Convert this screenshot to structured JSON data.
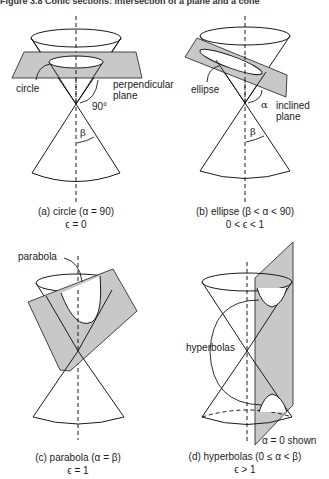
{
  "figure": {
    "title": "Figure 3.8 Conic sections: intersection of a plane and a cone",
    "panels": [
      {
        "id": "a",
        "caption_line1": "(a) circle (α = 90)",
        "caption_line2": "ϵ = 0",
        "labels": {
          "curve": "circle",
          "plane_line1": "perpendicular",
          "plane_line2": "plane",
          "angle": "90°",
          "half_angle": "β"
        }
      },
      {
        "id": "b",
        "caption_line1": "(b) ellipse (β < α < 90)",
        "caption_line2": "0 < ϵ < 1",
        "labels": {
          "curve": "ellipse",
          "plane_line1": "inclined",
          "plane_line2": "plane",
          "angle": "α",
          "half_angle": "β"
        }
      },
      {
        "id": "c",
        "caption_line1": "(c) parabola (α = β)",
        "caption_line2": "ϵ = 1",
        "labels": {
          "curve": "parabola"
        }
      },
      {
        "id": "d",
        "caption_line1": "(d) hyperbolas (0 ≤ α < β)",
        "caption_line2": "ϵ > 1",
        "labels": {
          "curve": "hyperbolas",
          "note": "α = 0 shown"
        }
      }
    ]
  },
  "colors": {
    "plane_fill": "#c8c8c8",
    "line": "#1a1a1a",
    "background": "#ffffff"
  }
}
